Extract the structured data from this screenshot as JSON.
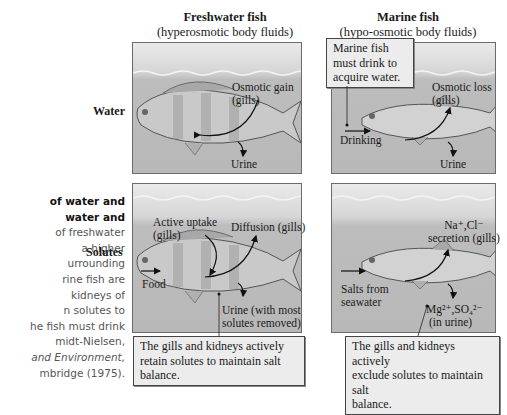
{
  "caption": {
    "lines": [
      {
        "text": "of water and",
        "style": "bold"
      },
      {
        "text": "water and",
        "style": "bold"
      },
      {
        "text": "of freshwater",
        "style": "normal"
      },
      {
        "text": "a higher",
        "style": "normal"
      },
      {
        "text": "urrounding",
        "style": "normal"
      },
      {
        "text": "rine fish are",
        "style": "normal"
      },
      {
        "text": "kidneys of",
        "style": "normal"
      },
      {
        "text": "n solutes to",
        "style": "normal"
      },
      {
        "text": "he fish must drink",
        "style": "normal"
      },
      {
        "text": "midt-Nielsen,",
        "style": "normal"
      },
      {
        "text": "and Environment,",
        "style": "italic"
      },
      {
        "text": "mbridge (1975).",
        "style": "normal"
      }
    ]
  },
  "columns": {
    "freshwater": {
      "title": "Freshwater fish",
      "subtitle": "(hyperosmotic body fluids)"
    },
    "marine": {
      "title": "Marine fish",
      "subtitle": "(hypo-osmotic body fluids)"
    }
  },
  "rows": {
    "water": {
      "label": "Water"
    },
    "solutes": {
      "label": "Solutes"
    }
  },
  "panels": {
    "freshwater_water": {
      "osmotic_gain_1": "Osmotic gain",
      "osmotic_gain_2": "(gills)",
      "urine": "Urine"
    },
    "marine_water": {
      "callout_1": "Marine fish",
      "callout_2": "must drink to",
      "callout_3": "acquire water.",
      "osmotic_loss_1": "Osmotic loss",
      "osmotic_loss_2": "(gills)",
      "drinking": "Drinking",
      "urine": "Urine"
    },
    "freshwater_solutes": {
      "active_uptake_1": "Active uptake",
      "active_uptake_2": "(gills)",
      "diffusion": "Diffusion (gills)",
      "food": "Food",
      "urine_1": "Urine (with most",
      "urine_2": "solutes removed)",
      "callout_1": "The gills and kidneys actively",
      "callout_2": "retain solutes to maintain salt",
      "callout_3": "balance."
    },
    "marine_solutes": {
      "secretion_1": "Na⁺,Cl⁻",
      "secretion_2": "secretion (gills)",
      "salts_1": "Salts from",
      "salts_2": "seawater",
      "mg_1": "Mg²⁺,SO₄²⁻",
      "mg_2": "(in urine)",
      "callout_1": "The gills and kidneys actively",
      "callout_2": "exclude solutes to maintain salt",
      "callout_3": "balance."
    }
  },
  "colors": {
    "panel_top": "#eaeaea",
    "panel_water": "#b8b8b8",
    "border": "#6b6b6b",
    "callout_bg": "#ececec",
    "text": "#1a1a1a"
  }
}
